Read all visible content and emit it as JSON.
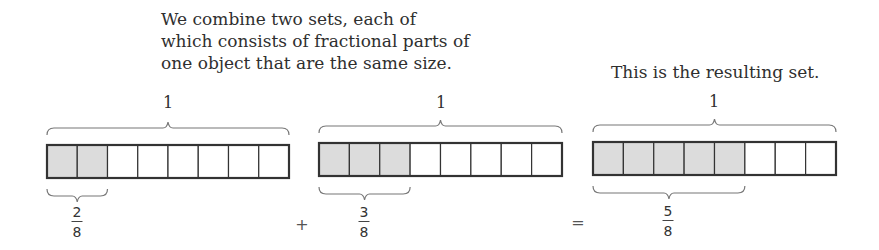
{
  "captions": {
    "left": [
      "We combine two sets, each of",
      "which consists of fractional parts of",
      "one object that are the same size."
    ],
    "right": "This is the resulting set."
  },
  "colors": {
    "shaded": "#dcdcdc",
    "outline": "#333333",
    "brace": "#777777"
  },
  "sets": [
    {
      "whole_label": "1",
      "parts": 8,
      "shaded": 2,
      "fraction": {
        "numerator": "2",
        "denominator": "8"
      }
    },
    {
      "whole_label": "1",
      "parts": 8,
      "shaded": 3,
      "fraction": {
        "numerator": "3",
        "denominator": "8"
      }
    },
    {
      "whole_label": "1",
      "parts": 8,
      "shaded": 5,
      "fraction": {
        "numerator": "5",
        "denominator": "8"
      }
    }
  ],
  "operators": {
    "plus": "+",
    "equals": "="
  }
}
